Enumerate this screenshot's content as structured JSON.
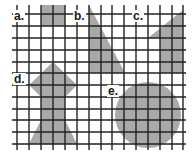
{
  "figure": {
    "width": 194,
    "height": 155,
    "background": "#ffffff",
    "grid_color": "#222222",
    "shape_fill": "#a9a9a9",
    "grid": {
      "vertical_x": [
        17,
        29,
        41,
        53,
        65,
        77,
        89,
        101,
        112,
        124,
        136,
        148,
        160,
        172,
        183
      ],
      "horizontal_y": [
        14,
        26,
        38,
        50,
        62,
        73,
        85,
        97,
        109,
        120,
        132,
        144
      ],
      "top": 5,
      "bottom": 150,
      "left": 12,
      "right": 186
    },
    "labels": [
      {
        "id": "a",
        "text": "a.",
        "x": 13,
        "y": 10
      },
      {
        "id": "b",
        "text": "b.",
        "x": 73,
        "y": 10
      },
      {
        "id": "c",
        "text": "c.",
        "x": 132,
        "y": 10
      },
      {
        "id": "d",
        "text": "d.",
        "x": 13,
        "y": 73
      },
      {
        "id": "e",
        "text": "e.",
        "x": 107,
        "y": 85
      }
    ],
    "shapes": [
      {
        "id": "a",
        "type": "square",
        "points": "41,5 65,5 65,26 41,26"
      },
      {
        "id": "b",
        "type": "triangle",
        "points": "89,5 89,73 125,73"
      },
      {
        "id": "c",
        "type": "triangle-trapezoid",
        "points": "183,10 148,38 160,38 160,73 183,73"
      },
      {
        "id": "d",
        "type": "arrow-diamond",
        "points": "53,62 77,85 65,97 65,120 77,144 29,144 41,120 41,97 29,85"
      },
      {
        "id": "e",
        "type": "circle",
        "cx": 148,
        "cy": 115,
        "r": 33
      }
    ]
  }
}
